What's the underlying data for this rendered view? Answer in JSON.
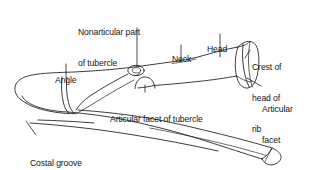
{
  "figure": {
    "subject": "rib",
    "view": "posterior-superior oblique",
    "background_color": "#ffffff",
    "line_color": "#1a1a1a",
    "text_color": "#141414"
  },
  "labels": [
    {
      "id": "nonarticular-part-of-tubercle",
      "line1": "Nonarticular part",
      "line2": "of tubercle",
      "x": 78,
      "y": 7,
      "align": "left"
    },
    {
      "id": "neck",
      "line1": "Neck",
      "line2": "",
      "x": 172,
      "y": 34,
      "align": "left"
    },
    {
      "id": "head",
      "line1": "Head",
      "line2": "",
      "x": 207,
      "y": 24,
      "align": "left"
    },
    {
      "id": "crest-of-head-of-rib",
      "line1": "Crest of",
      "line2": "head of",
      "line3": "rib",
      "x": 252,
      "y": 42,
      "align": "left"
    },
    {
      "id": "articular-facet",
      "line1": "Articular",
      "line2": "facet",
      "x": 262,
      "y": 84,
      "align": "left"
    },
    {
      "id": "angle",
      "line1": "Angle",
      "line2": "",
      "x": 55,
      "y": 55,
      "align": "left"
    },
    {
      "id": "articular-facet-of-tubercle",
      "line1": "Articular facet of tubercle",
      "line2": "",
      "x": 110,
      "y": 94,
      "align": "left"
    },
    {
      "id": "costal-groove",
      "line1": "Costal groove",
      "line2": "",
      "x": 30,
      "y": 138,
      "align": "left"
    }
  ]
}
